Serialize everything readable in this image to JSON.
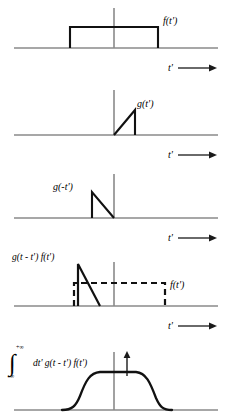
{
  "figure": {
    "colors": {
      "axis": "#8a8a8a",
      "curve": "#111111",
      "background": "#ffffff"
    },
    "panels": [
      {
        "id": "panel-1",
        "signal_label": "f(t')",
        "axis_label": "t'",
        "shape": "rectangular-pulse",
        "baseline_y": 48,
        "origin_x": 114,
        "pulse": {
          "x_start": 70,
          "x_end": 158,
          "top_y": 27
        },
        "vertical_axis": {
          "x": 114,
          "y_top": 8,
          "y_bottom": 48
        }
      },
      {
        "id": "panel-2",
        "signal_label": "g(t')",
        "axis_label": "t'",
        "shape": "rising-ramp",
        "baseline_y": 135,
        "origin_x": 114,
        "ramp": {
          "x_start": 114,
          "x_peak": 135,
          "peak_y": 110
        },
        "vertical_axis": {
          "x": 114,
          "y_top": 90,
          "y_bottom": 135
        }
      },
      {
        "id": "panel-3",
        "signal_label": "g(-t')",
        "axis_label": "t'",
        "shape": "reflected-ramp",
        "baseline_y": 218,
        "origin_x": 114,
        "ramp": {
          "x_peak": 92,
          "peak_y": 192,
          "x_end": 114
        },
        "vertical_axis": {
          "x": 114,
          "y_top": 174,
          "y_bottom": 218
        }
      },
      {
        "id": "panel-4",
        "signal_label": "g(t - t') f(t')",
        "overlay_label": "f(t')",
        "axis_label": "t'",
        "shape": "shifted-ramp-over-dashed-pulse",
        "baseline_y": 306,
        "origin_x": 114,
        "ramp": {
          "x_peak": 78,
          "peak_y": 264,
          "x_end": 100
        },
        "dashed_pulse": {
          "x_start": 74,
          "x_end": 165,
          "top_y": 283
        },
        "vertical_axis": {
          "x": 114,
          "y_top": 262,
          "y_bottom": 306
        }
      },
      {
        "id": "panel-5",
        "signal_label": "dt' g(t - t') f(t')",
        "integral_symbol": "∫",
        "limit_upper": "+∞",
        "limit_lower": "-∞",
        "shape": "convolution-trapezoid",
        "baseline_y": 410,
        "origin_x": 114,
        "trapezoid": {
          "x_rise_start": 78,
          "x_flat_start": 100,
          "x_flat_end": 138,
          "x_fall_end": 160,
          "top_y": 372
        },
        "vertical_axis": {
          "x": 114,
          "y_top": 352,
          "y_bottom": 410
        },
        "arrow_marker": {
          "x": 127,
          "y_top": 352,
          "y_bottom": 374
        }
      }
    ],
    "axis_arrow_glyph": "⟶"
  }
}
